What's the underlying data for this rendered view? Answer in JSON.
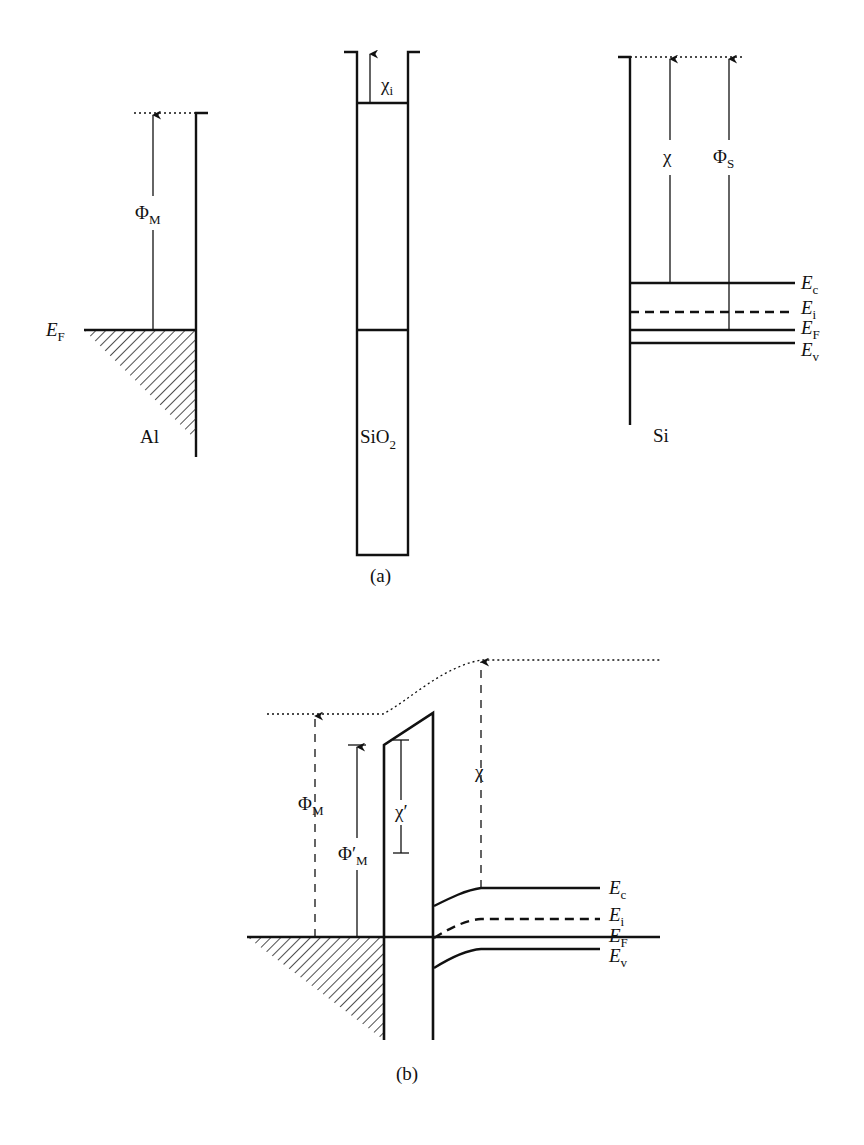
{
  "figure": {
    "panel_a": {
      "caption": "(a)",
      "metal": {
        "name": "Al",
        "fermi_label": "E",
        "fermi_sub": "F",
        "workfunction_label": "Φ",
        "workfunction_sub": "M"
      },
      "oxide": {
        "name": "SiO",
        "name_sub": "2",
        "affinity_label": "χ",
        "affinity_sub": "i"
      },
      "semiconductor": {
        "name": "Si",
        "affinity_label": "χ",
        "workfunction_label": "Φ",
        "workfunction_sub": "S",
        "levels": [
          {
            "label": "E",
            "sub": "c",
            "style": "solid"
          },
          {
            "label": "E",
            "sub": "i",
            "style": "dashed"
          },
          {
            "label": "E",
            "sub": "F",
            "style": "solid"
          },
          {
            "label": "E",
            "sub": "v",
            "style": "solid"
          }
        ]
      }
    },
    "panel_b": {
      "caption": "(b)",
      "metal_workfunction_label": "Φ",
      "metal_workfunction_sub": "M",
      "barrier_label": "Φ′",
      "barrier_sub": "M",
      "oxide_affinity_label": "χ′",
      "semiconductor_affinity_label": "χ",
      "levels": [
        {
          "label": "E",
          "sub": "c",
          "style": "solid"
        },
        {
          "label": "E",
          "sub": "i",
          "style": "dashed"
        },
        {
          "label": "E",
          "sub": "F",
          "style": "solid"
        },
        {
          "label": "E",
          "sub": "v",
          "style": "solid"
        }
      ]
    }
  }
}
